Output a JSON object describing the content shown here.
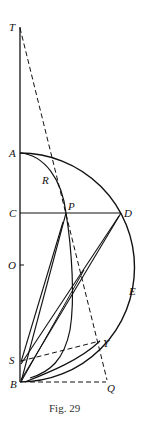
{
  "figure": {
    "caption": "Fig. 29",
    "points": {
      "T": "T",
      "A": "A",
      "R": "R",
      "C": "C",
      "P": "P",
      "D": "D",
      "O": "O",
      "E": "E",
      "S": "S",
      "Y": "Y",
      "B": "B",
      "Q": "Q"
    },
    "colors": {
      "ink": "#111111",
      "background": "#ffffff"
    }
  }
}
